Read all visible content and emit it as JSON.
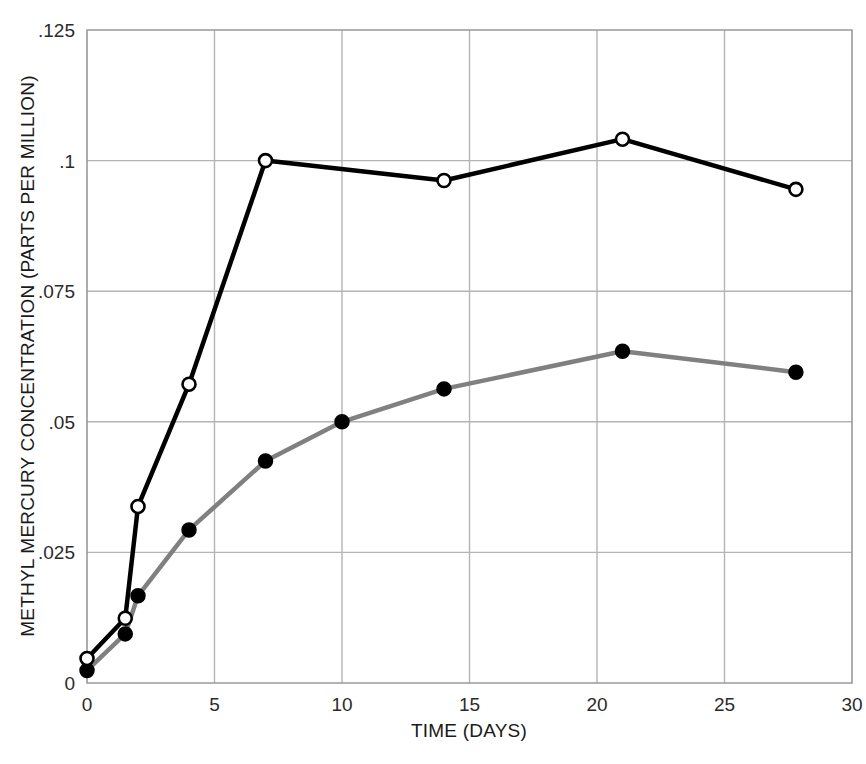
{
  "chart_data": {
    "type": "line",
    "title": "",
    "xlabel": "TIME (DAYS)",
    "ylabel": "METHYL MERCURY CONCENTRATION (PARTS PER MILLION)",
    "xlim": [
      0,
      30
    ],
    "ylim": [
      0,
      0.125
    ],
    "xticks": [
      0,
      5,
      10,
      15,
      20,
      25,
      30
    ],
    "xtick_labels": [
      "0",
      "5",
      "10",
      "15",
      "20",
      "25",
      "30"
    ],
    "yticks": [
      0,
      0.025,
      0.05,
      0.075,
      0.1,
      0.125
    ],
    "ytick_labels": [
      "0",
      ".025",
      ".05",
      ".075",
      ".1",
      ".125"
    ],
    "grid": true,
    "grid_color": "#b4b4b4",
    "legend": null,
    "series": [
      {
        "name": "open-circle-series",
        "marker": "open-circle",
        "line_color": "#000000",
        "marker_fill": "#ffffff",
        "marker_edge": "#000000",
        "line_width": 4.5,
        "x": [
          0,
          1.5,
          2,
          4,
          7,
          14,
          21,
          27.8
        ],
        "y": [
          0.0047,
          0.0124,
          0.0338,
          0.0572,
          0.1,
          0.0962,
          0.1041,
          0.0945
        ]
      },
      {
        "name": "filled-circle-series",
        "marker": "filled-circle",
        "line_color": "#808080",
        "marker_fill": "#000000",
        "marker_edge": "#000000",
        "line_width": 4.5,
        "x": [
          0,
          1.5,
          2,
          4,
          7,
          10,
          14,
          21,
          27.8
        ],
        "y": [
          0.0024,
          0.0094,
          0.0167,
          0.0293,
          0.0425,
          0.05,
          0.0563,
          0.0635,
          0.0595
        ]
      }
    ]
  }
}
